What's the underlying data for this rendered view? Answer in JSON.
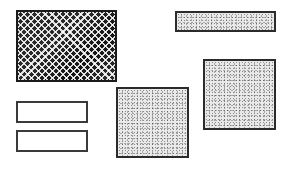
{
  "diagram": {
    "shapes": [
      {
        "id": "crosshatched-rectangle",
        "fill": "crosshatch",
        "x": 16,
        "y": 10,
        "w": 101,
        "h": 72
      },
      {
        "id": "stippled-bar-top-right",
        "fill": "stipple",
        "x": 175,
        "y": 11,
        "w": 101,
        "h": 21
      },
      {
        "id": "stippled-square-right",
        "fill": "stipple",
        "x": 203,
        "y": 59,
        "w": 73,
        "h": 71
      },
      {
        "id": "stippled-square-middle",
        "fill": "stipple",
        "x": 116,
        "y": 87,
        "w": 73,
        "h": 71
      },
      {
        "id": "empty-rectangle-upper",
        "fill": "none",
        "x": 16,
        "y": 101,
        "w": 72,
        "h": 22
      },
      {
        "id": "empty-rectangle-lower",
        "fill": "none",
        "x": 16,
        "y": 130,
        "w": 72,
        "h": 22
      }
    ],
    "colors": {
      "background": "#ffffff",
      "border": "#2b2b2b",
      "hatch_dark": "#2a2a2a",
      "stipple_base": "#e9e9e9"
    }
  }
}
